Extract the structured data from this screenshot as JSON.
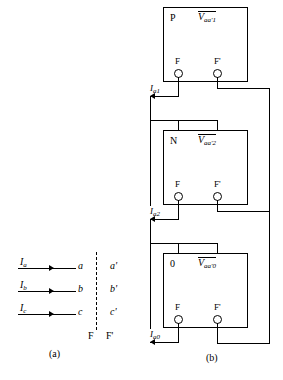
{
  "figure": {
    "part_a": {
      "caption": "(a)",
      "plane_labels": {
        "left": "F",
        "right": "F'"
      },
      "rows": [
        {
          "current": "I",
          "current_sub": "a",
          "left_node": "a",
          "right_node": "a'"
        },
        {
          "current": "I",
          "current_sub": "b",
          "left_node": "b",
          "right_node": "b'"
        },
        {
          "current": "I",
          "current_sub": "c",
          "left_node": "c",
          "right_node": "c'"
        }
      ]
    },
    "part_b": {
      "caption": "(b)",
      "networks": [
        {
          "name": "positive-sequence",
          "id_label": "P",
          "voltage": "V",
          "voltage_sub": "aa'1",
          "terminal_left": "F",
          "terminal_right": "F'",
          "current": "I",
          "current_sub": "a1"
        },
        {
          "name": "negative-sequence",
          "id_label": "N",
          "voltage": "V",
          "voltage_sub": "aa'2",
          "terminal_left": "F",
          "terminal_right": "F'",
          "current": "I",
          "current_sub": "a2"
        },
        {
          "name": "zero-sequence",
          "id_label": "0",
          "voltage": "V",
          "voltage_sub": "aa'0",
          "terminal_left": "F",
          "terminal_right": "F'",
          "current": "I",
          "current_sub": "a0"
        }
      ]
    }
  },
  "colors": {
    "ink": "#000000",
    "paper": "#ffffff"
  }
}
